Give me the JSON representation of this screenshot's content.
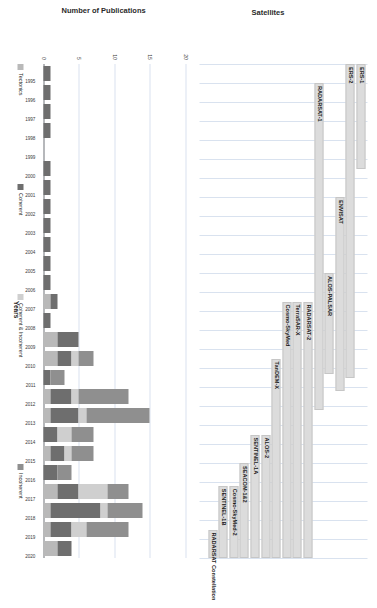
{
  "figure": {
    "orientation": "rotated-90",
    "background": "#ffffff"
  },
  "panels": {
    "satellites": {
      "axis_title": "Satellites",
      "x_range": [
        1995,
        2021
      ]
    },
    "publications": {
      "axis_title": "Number of Publications",
      "x_axis_title": "Years",
      "y_ticks": [
        "0",
        "5",
        "10",
        "15",
        "20"
      ]
    }
  },
  "legend": {
    "items": [
      {
        "label": "Tectonics",
        "color": "#b9b9b9"
      },
      {
        "label": "Coherent",
        "color": "#6e6e6e"
      },
      {
        "label": "Coherent & Incoherent",
        "color": "#cfcfcf"
      },
      {
        "label": "Incoherent",
        "color": "#8f8f8f"
      }
    ]
  },
  "chart_data": [
    {
      "type": "bar",
      "name": "satellite-timeline",
      "title": "",
      "xlabel": "",
      "ylabel": "Satellites",
      "xlim": [
        1995,
        2021
      ],
      "grid": true,
      "orientation": "horizontal",
      "bar_color": "#dcdcdc",
      "categories": [
        "ERS-1",
        "ERS-2",
        "ENVISAT",
        "ALOS-PALSAR",
        "RADARSAT-1",
        "RADARSAT-2",
        "TerraSAR-X",
        "Cosmo-SkyMed",
        "TanDEM-X",
        "ALOS-2",
        "SENTINEL-1A",
        "SEACOM-1&2",
        "Cosmo-SkyMed-2",
        "SENTINEL-1B",
        "RADARSAT Constellation"
      ],
      "spans": [
        {
          "label": "ERS-1",
          "start": 1995,
          "end": 2000.5
        },
        {
          "label": "ERS-2",
          "start": 1995,
          "end": 2011.5
        },
        {
          "label": "ENVISAT",
          "start": 2002,
          "end": 2012.2
        },
        {
          "label": "ALOS-PALSAR",
          "start": 2006,
          "end": 2011.3
        },
        {
          "label": "RADARSAT-1",
          "start": 1996,
          "end": 2013.2
        },
        {
          "label": "RADARSAT-2",
          "start": 2007.5,
          "end": 2021
        },
        {
          "label": "TerraSAR-X",
          "start": 2007.5,
          "end": 2021
        },
        {
          "label": "Cosmo-SkyMed",
          "start": 2007.5,
          "end": 2021
        },
        {
          "label": "TanDEM-X",
          "start": 2010.5,
          "end": 2021
        },
        {
          "label": "ALOS-2",
          "start": 2014.5,
          "end": 2021
        },
        {
          "label": "SENTINEL-1A",
          "start": 2014.5,
          "end": 2021
        },
        {
          "label": "SEACOM-1&2",
          "start": 2016,
          "end": 2021
        },
        {
          "label": "Cosmo-SkyMed-2",
          "start": 2017.2,
          "end": 2021
        },
        {
          "label": "SENTINEL-1B",
          "start": 2017.2,
          "end": 2021
        },
        {
          "label": "RADARSAT Constellation",
          "start": 2019.5,
          "end": 2021
        }
      ]
    },
    {
      "type": "bar",
      "name": "publications-by-year",
      "title": "",
      "xlabel": "Years",
      "ylabel": "Number of Publications",
      "ylim": [
        0,
        20
      ],
      "yticks": [
        0,
        5,
        10,
        15,
        20
      ],
      "grid": true,
      "stacked": true,
      "legend_position": "bottom",
      "categories": [
        "1995",
        "1996",
        "1997",
        "1998",
        "1999",
        "2000",
        "2001",
        "2002",
        "2003",
        "2004",
        "2005",
        "2006",
        "2007",
        "2008",
        "2009",
        "2010",
        "2011",
        "2012",
        "2013",
        "2014",
        "2015",
        "2016",
        "2017",
        "2018",
        "2019",
        "2020"
      ],
      "series": [
        {
          "name": "Tectonics",
          "color": "#b9b9b9",
          "values": [
            0,
            0,
            0,
            0,
            0,
            0,
            0,
            0,
            0,
            0,
            0,
            0,
            1,
            0,
            2,
            2,
            0,
            1,
            1,
            0,
            1,
            0,
            2,
            1,
            1,
            2
          ]
        },
        {
          "name": "Coherent",
          "color": "#6e6e6e",
          "values": [
            1,
            1,
            1,
            1,
            0,
            1,
            1,
            1,
            1,
            1,
            1,
            1,
            1,
            1,
            3,
            2,
            1,
            3,
            4,
            2,
            2,
            2,
            3,
            7,
            3,
            2
          ]
        },
        {
          "name": "Coherent & Incoherent",
          "color": "#cfcfcf",
          "values": [
            0,
            0,
            0,
            0,
            0,
            0,
            0,
            0,
            0,
            0,
            0,
            0,
            0,
            0,
            0,
            1,
            0,
            1,
            1,
            2,
            1,
            0,
            4,
            1,
            2,
            0
          ]
        },
        {
          "name": "Incoherent",
          "color": "#8f8f8f",
          "values": [
            0,
            0,
            0,
            0,
            0,
            0,
            0,
            0,
            0,
            0,
            0,
            0,
            0,
            0,
            0,
            2,
            2,
            7,
            9,
            3,
            3,
            2,
            3,
            5,
            6,
            0
          ]
        }
      ],
      "totals": [
        1,
        1,
        1,
        1,
        0,
        1,
        1,
        1,
        1,
        1,
        1,
        1,
        2,
        1,
        5,
        7,
        3,
        12,
        15,
        7,
        7,
        4,
        12,
        14,
        12,
        4
      ]
    }
  ]
}
